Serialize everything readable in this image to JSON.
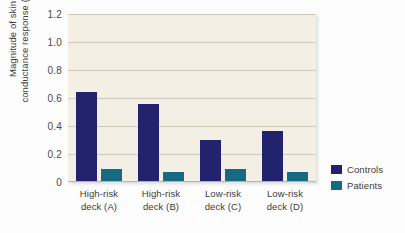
{
  "chart_data": {
    "type": "bar",
    "title": "",
    "subtitle": "",
    "xlabel": "",
    "ylabel_line1": "Magnitude of skin",
    "ylabel_line2": "conductance response (SCR)",
    "categories": [
      {
        "line1": "High-risk",
        "line2": "deck (A)"
      },
      {
        "line1": "High-risk",
        "line2": "deck (B)"
      },
      {
        "line1": "Low-risk",
        "line2": "deck (C)"
      },
      {
        "line1": "Low-risk",
        "line2": "deck (D)"
      }
    ],
    "series": [
      {
        "name": "Controls",
        "color": "#23236d",
        "values": [
          0.64,
          0.555,
          0.3,
          0.365
        ]
      },
      {
        "name": "Patients",
        "color": "#166b82",
        "values": [
          0.09,
          0.075,
          0.095,
          0.07
        ]
      }
    ],
    "ylim": [
      0,
      1.2
    ],
    "yticks": [
      "0",
      "0.2",
      "0.4",
      "0.6",
      "0.8",
      "1.0",
      "1.2"
    ],
    "ytick_values": [
      0,
      0.2,
      0.4,
      0.6,
      0.8,
      1.0,
      1.2
    ],
    "grid": true,
    "grid_axis": "y",
    "legend_position": "right",
    "plot_background": "#f3efe4"
  },
  "legend": {
    "entries": [
      {
        "label": "Controls",
        "color": "#23236d"
      },
      {
        "label": "Patients",
        "color": "#166b82"
      }
    ]
  }
}
